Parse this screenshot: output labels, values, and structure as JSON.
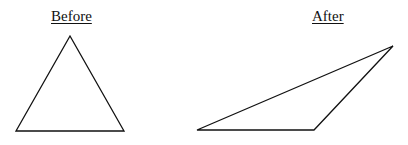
{
  "labels": {
    "before": "Before",
    "after": "After"
  },
  "shapes": {
    "before_triangle": {
      "points": "70,36 16,131 124,131",
      "stroke": "#111111"
    },
    "after_triangle": {
      "points": "197,130 314,130 393,46",
      "stroke": "#111111"
    }
  }
}
